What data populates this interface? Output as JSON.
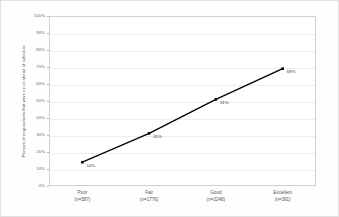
{
  "chart_data": {
    "type": "line",
    "title": "",
    "xlabel": "",
    "ylabel": "Percent of respondents that were on or ahead of schedule",
    "categories": [
      "Poor",
      "Fair",
      "Good",
      "Excellent"
    ],
    "category_counts": [
      "(n=587)",
      "(n=1776)",
      "(n=2248)",
      "(n=391)"
    ],
    "values": [
      14,
      31,
      51,
      69
    ],
    "point_labels": [
      "14%",
      "31%",
      "51%",
      "69%"
    ],
    "ylim": [
      0,
      100
    ],
    "ytick_values": [
      0,
      10,
      20,
      30,
      40,
      50,
      60,
      70,
      80,
      90,
      100
    ],
    "ytick_labels": [
      "0%",
      "10%",
      "20%",
      "30%",
      "40%",
      "50%",
      "60%",
      "70%",
      "80%",
      "90%",
      "100%"
    ],
    "grid": true,
    "legend": "none",
    "series_color": "#000000",
    "marker": "square",
    "gridline_color": "#ededed",
    "axis_color": "#cfcfcf",
    "background_color": "#ffffff"
  }
}
